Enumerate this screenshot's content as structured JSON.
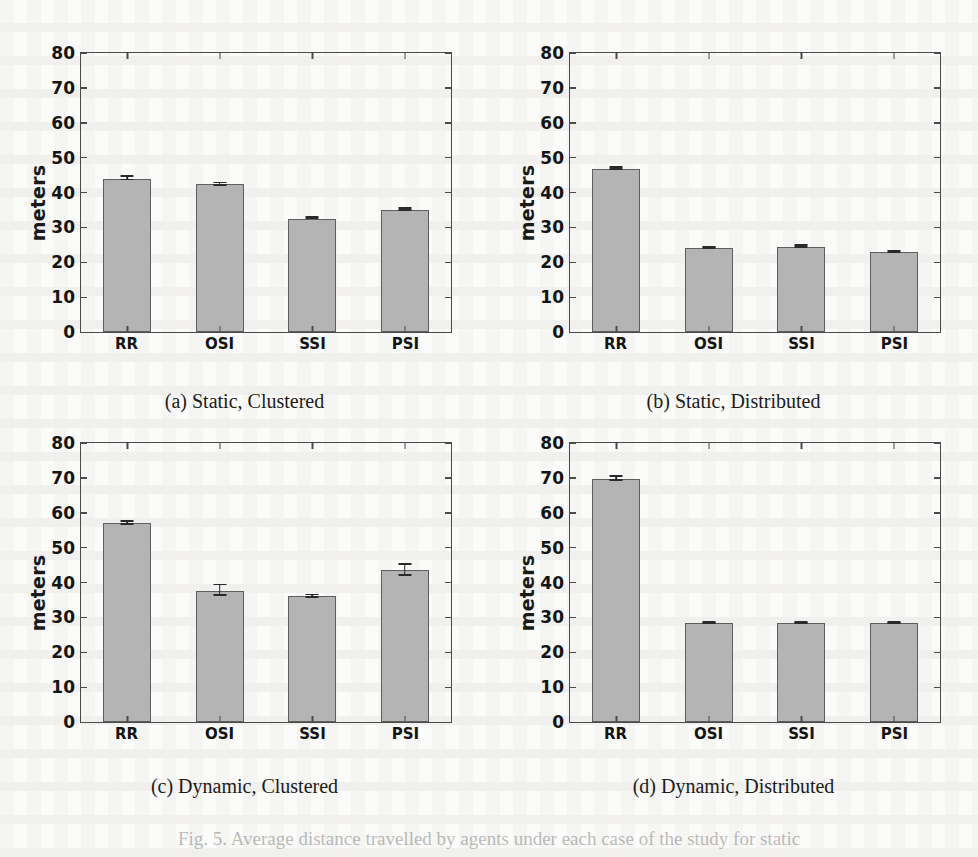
{
  "figure": {
    "caption": "Fig. 5. Average distance travelled by agents under each case of the study for static",
    "ylabel": "meters",
    "bar_color": "#b4b4b4",
    "bar_edge_color": "#5e5e5e",
    "axis_color": "#4a4a4a"
  },
  "chart_data": [
    {
      "type": "bar",
      "panel": "a",
      "title": "(a) Static, Clustered",
      "categories": [
        "RR",
        "OSI",
        "SSI",
        "PSI"
      ],
      "values": [
        44.0,
        42.3,
        32.5,
        35.0
      ],
      "errors": [
        0.5,
        0.4,
        0.2,
        0.3
      ],
      "xlabel": "",
      "ylabel": "meters",
      "ylim": [
        0,
        80
      ],
      "yticks": [
        0,
        10,
        20,
        30,
        40,
        50,
        60,
        70,
        80
      ],
      "grid": false,
      "legend": "none"
    },
    {
      "type": "bar",
      "panel": "b",
      "title": "(b) Static, Distributed",
      "categories": [
        "RR",
        "OSI",
        "SSI",
        "PSI"
      ],
      "values": [
        46.8,
        24.0,
        24.5,
        23.0
      ],
      "errors": [
        0.3,
        0.2,
        0.3,
        0.2
      ],
      "xlabel": "",
      "ylabel": "meters",
      "ylim": [
        0,
        80
      ],
      "yticks": [
        0,
        10,
        20,
        30,
        40,
        50,
        60,
        70,
        80
      ],
      "grid": false,
      "legend": "none"
    },
    {
      "type": "bar",
      "panel": "c",
      "title": "(c) Dynamic, Clustered",
      "categories": [
        "RR",
        "OSI",
        "SSI",
        "PSI"
      ],
      "values": [
        57.0,
        37.7,
        36.0,
        43.5
      ],
      "errors": [
        0.4,
        1.5,
        0.3,
        1.6
      ],
      "xlabel": "",
      "ylabel": "meters",
      "ylim": [
        0,
        80
      ],
      "yticks": [
        0,
        10,
        20,
        30,
        40,
        50,
        60,
        70,
        80
      ],
      "grid": false,
      "legend": "none"
    },
    {
      "type": "bar",
      "panel": "d",
      "title": "(d) Dynamic, Distributed",
      "categories": [
        "RR",
        "OSI",
        "SSI",
        "PSI"
      ],
      "values": [
        69.7,
        28.3,
        28.3,
        28.3
      ],
      "errors": [
        0.6,
        0.2,
        0.2,
        0.2
      ],
      "xlabel": "",
      "ylabel": "meters",
      "ylim": [
        0,
        80
      ],
      "yticks": [
        0,
        10,
        20,
        30,
        40,
        50,
        60,
        70,
        80
      ],
      "grid": false,
      "legend": "none"
    }
  ]
}
